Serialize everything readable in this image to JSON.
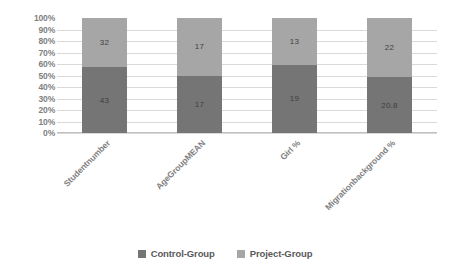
{
  "chart_data": {
    "type": "bar",
    "subtype": "100%-stacked-bar",
    "title": "",
    "xlabel": "",
    "ylabel": "",
    "ylim": [
      0,
      100
    ],
    "grid": true,
    "legend_position": "bottom",
    "categories": [
      "Studentnumber",
      "AgeGroupMEAN",
      "Girl %",
      "Migrationbackground %"
    ],
    "y_ticks": [
      "0%",
      "10%",
      "20%",
      "30%",
      "40%",
      "50%",
      "60%",
      "70%",
      "80%",
      "90%",
      "100%"
    ],
    "series": [
      {
        "name": "Control-Group",
        "color": "#757575",
        "stack_position": "bottom",
        "values": [
          43,
          17,
          19,
          20.8
        ],
        "labels": [
          "43",
          "17",
          "19",
          "20.8"
        ],
        "percent_of_total": [
          57.3,
          50.0,
          59.4,
          48.6
        ]
      },
      {
        "name": "Project-Group",
        "color": "#a6a6a6",
        "stack_position": "top",
        "values": [
          32,
          17,
          13,
          22
        ],
        "labels": [
          "32",
          "17",
          "13",
          "22"
        ],
        "percent_of_total": [
          42.7,
          50.0,
          40.6,
          51.4
        ]
      }
    ]
  },
  "colors": {
    "control_group": "#757575",
    "project_group": "#a6a6a6",
    "gridline": "#d9d9d9",
    "axis_text": "#7f7f7f",
    "category_text": "#808080",
    "legend_text": "#595959",
    "data_label_text": "#3f3f3f",
    "background": "#ffffff"
  }
}
